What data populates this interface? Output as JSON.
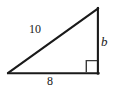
{
  "figure": {
    "kind": "right-triangle-diagram",
    "canvas": {
      "width": 118,
      "height": 92
    },
    "background_color": "#ffffff",
    "stroke_color": "#1a1a1a",
    "text_color": "#1a1a1a",
    "vertices": {
      "left": {
        "x": 8,
        "y": 73
      },
      "bottom_right": {
        "x": 98,
        "y": 73
      },
      "apex": {
        "x": 98,
        "y": 8
      }
    },
    "right_angle_marker": {
      "at_vertex": "bottom_right",
      "size": 12,
      "style": "open-square"
    },
    "labels": {
      "hypotenuse": "10",
      "vertical_leg": "b",
      "base_leg": "8"
    }
  }
}
